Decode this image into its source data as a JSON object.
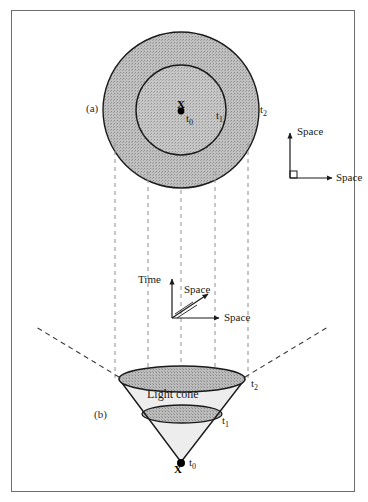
{
  "figure": {
    "panels": [
      {
        "key": "a",
        "label": "(a)",
        "caption_role": "spatial-slice-view"
      },
      {
        "key": "b",
        "label": "(b)",
        "caption_role": "light-cone-view"
      }
    ],
    "time_labels": [
      {
        "id": "t0",
        "text": "t",
        "sub": "0"
      },
      {
        "id": "t1",
        "text": "t",
        "sub": "1"
      },
      {
        "id": "t2",
        "text": "t",
        "sub": "2"
      }
    ],
    "event_marker": "X",
    "cone_label": "Light cone",
    "axes_top": {
      "vertical_label": "Space",
      "horizontal_label": "Space"
    },
    "axes_middle": {
      "vertical_label": "Time",
      "diagonal_label": "Space",
      "horizontal_label": "Space"
    },
    "colors": {
      "ink": "#1a1a1a",
      "frame": "#6d6d6d",
      "fill_outer": "#b9b9b9",
      "fill_inner": "#c3c3c3",
      "fill_cone_body": "#e4e4e4",
      "fill_ellipse_top": "#b4b4b4",
      "fill_ellipse_mid": "#bdbdbd",
      "dash": "#9a9a9a"
    }
  }
}
